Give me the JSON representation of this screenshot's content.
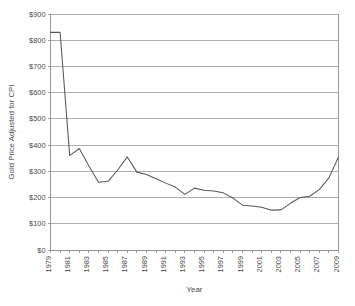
{
  "chart_data": {
    "type": "line",
    "title": "",
    "xlabel": "Year",
    "ylabel": "Gold Price Adjusted for CPI",
    "xlim": [
      1979,
      2009
    ],
    "ylim": [
      0,
      900
    ],
    "grid": true,
    "legend": false,
    "y_tick_labels": [
      "$900",
      "$800",
      "$700",
      "$600",
      "$500",
      "$400",
      "$300",
      "$200",
      "$100",
      "$0"
    ],
    "y_tick_values": [
      900,
      800,
      700,
      600,
      500,
      400,
      300,
      200,
      100,
      0
    ],
    "x_tick_labels": [
      "1979",
      "1981",
      "1983",
      "1985",
      "1987",
      "1989",
      "1991",
      "1993",
      "1995",
      "1997",
      "1999",
      "2001",
      "2003",
      "2005",
      "2007",
      "2009"
    ],
    "x_tick_values": [
      1979,
      1981,
      1983,
      1985,
      1987,
      1989,
      1991,
      1993,
      1995,
      1997,
      1999,
      2001,
      2003,
      2005,
      2007,
      2009
    ],
    "x": [
      1979,
      1980,
      1981,
      1982,
      1983,
      1984,
      1985,
      1986,
      1987,
      1988,
      1989,
      1990,
      1991,
      1992,
      1993,
      1994,
      1995,
      1996,
      1997,
      1998,
      1999,
      2000,
      2001,
      2002,
      2003,
      2004,
      2005,
      2006,
      2007,
      2008,
      2009
    ],
    "values": [
      830,
      830,
      360,
      387,
      320,
      258,
      262,
      305,
      355,
      297,
      288,
      272,
      255,
      240,
      212,
      236,
      228,
      225,
      218,
      198,
      171,
      168,
      163,
      152,
      153,
      178,
      200,
      205,
      230,
      275,
      355
    ],
    "series": [
      {
        "name": "Gold Price Adjusted for CPI",
        "color": "#58585a",
        "values": [
          830,
          830,
          360,
          387,
          320,
          258,
          262,
          305,
          355,
          297,
          288,
          272,
          255,
          240,
          212,
          236,
          228,
          225,
          218,
          198,
          171,
          168,
          163,
          152,
          153,
          178,
          200,
          205,
          230,
          275,
          355
        ]
      }
    ],
    "colors": {
      "line": "#58585a",
      "grid": "#9a9a9a",
      "axis": "#8d8d8d",
      "text": "#4a4a4a",
      "background": "#ffffff"
    }
  }
}
